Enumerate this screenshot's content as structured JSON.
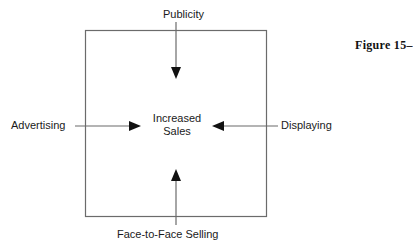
{
  "figure": {
    "caption": "Figure 15–",
    "box": {
      "x": 85,
      "y": 30,
      "width": 182,
      "height": 187
    },
    "center_label": {
      "line1": "Increased",
      "line2": "Sales",
      "text": "Increased Sales"
    },
    "inputs": [
      {
        "id": "publicity",
        "label": "Publicity",
        "direction": "down",
        "position": "top"
      },
      {
        "id": "advertising",
        "label": "Advertising",
        "direction": "right",
        "position": "left"
      },
      {
        "id": "displaying",
        "label": "Displaying",
        "direction": "left",
        "position": "right"
      },
      {
        "id": "face-to-face-selling",
        "label": "Face-to-Face Selling",
        "direction": "up",
        "position": "bottom"
      }
    ],
    "colors": {
      "line": "#6b6b6b",
      "arrow": "#111111",
      "text": "#1a1a1a",
      "background": "#ffffff"
    }
  }
}
